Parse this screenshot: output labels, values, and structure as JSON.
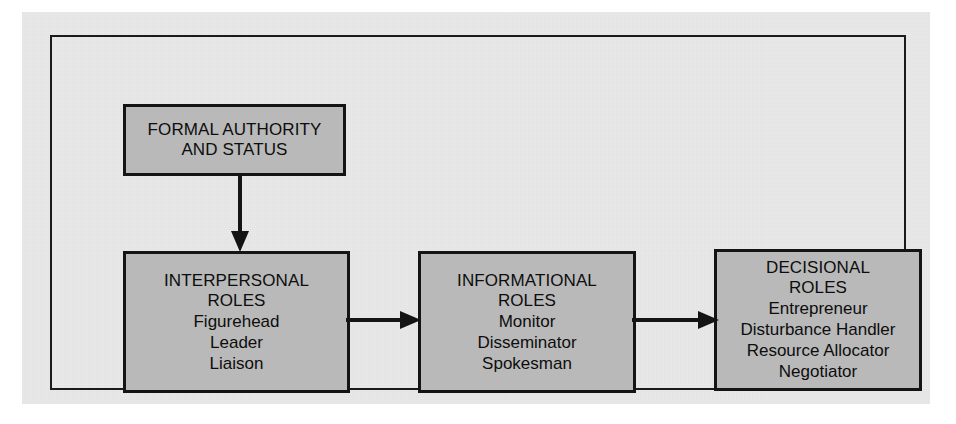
{
  "diagram": {
    "type": "flow-diagram",
    "colors": {
      "page_background": "#e9e9e9",
      "box_fill": "#b9b9b9",
      "line": "#141414",
      "text": "#0d0d0d"
    },
    "nodes": [
      {
        "id": "formal-authority",
        "title": "FORMAL AUTHORITY\nAND STATUS",
        "items": []
      },
      {
        "id": "interpersonal-roles",
        "title": "INTERPERSONAL\nROLES",
        "items": [
          "Figurehead",
          "Leader",
          "Liaison"
        ]
      },
      {
        "id": "informational-roles",
        "title": "INFORMATIONAL\nROLES",
        "items": [
          "Monitor",
          "Disseminator",
          "Spokesman"
        ]
      },
      {
        "id": "decisional-roles",
        "title": "DECISIONAL\nROLES",
        "items": [
          "Entrepreneur",
          "Disturbance Handler",
          "Resource Allocator",
          "Negotiator"
        ]
      }
    ],
    "arrows": [
      {
        "id": "authority-to-interpersonal",
        "from": "formal-authority",
        "to": "interpersonal-roles",
        "direction": "down"
      },
      {
        "id": "interpersonal-to-informational",
        "from": "interpersonal-roles",
        "to": "informational-roles",
        "direction": "right"
      },
      {
        "id": "informational-to-decisional",
        "from": "informational-roles",
        "to": "decisional-roles",
        "direction": "right"
      }
    ]
  }
}
